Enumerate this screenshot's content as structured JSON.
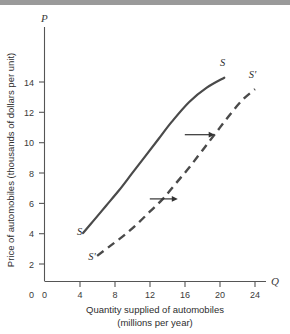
{
  "figure": {
    "background_color": "#ffffff",
    "top_band_color": "#9a9a9a",
    "curve_color": "#4a4a4a",
    "axis_color": "#555555"
  },
  "axes": {
    "y_symbol": "P",
    "x_symbol": "Q",
    "y_title": "Price of automobiles (thousands of dollars per unit)",
    "x_title_line1": "Quantity supplied of automobiles",
    "x_title_line2": "(millions per year)",
    "origin_label": "0"
  },
  "chart_data": {
    "type": "line",
    "title": "",
    "xlabel": "Quantity supplied of automobiles (millions per year)",
    "ylabel": "Price of automobiles (thousands of dollars per unit)",
    "xlim": [
      0,
      26
    ],
    "ylim": [
      0,
      15.5
    ],
    "xticks": [
      0,
      4,
      8,
      12,
      16,
      20,
      24
    ],
    "yticks": [
      0,
      2,
      4,
      6,
      8,
      10,
      12,
      14
    ],
    "xtick_labels": [
      "0",
      "4",
      "8",
      "12",
      "16",
      "20",
      "24"
    ],
    "ytick_labels": [
      "0",
      "2",
      "4",
      "6",
      "8",
      "10",
      "12",
      "14"
    ],
    "grid": false,
    "legend": "none",
    "series": [
      {
        "name": "S",
        "label": "S",
        "style": "solid",
        "label_position": "top",
        "points": [
          [
            4.4,
            3.4
          ],
          [
            5.5,
            4.2
          ],
          [
            7.0,
            5.3
          ],
          [
            8.5,
            6.4
          ],
          [
            10.0,
            7.6
          ],
          [
            11.5,
            8.8
          ],
          [
            13.0,
            10.0
          ],
          [
            14.5,
            11.2
          ],
          [
            16.5,
            12.6
          ],
          [
            18.5,
            13.6
          ],
          [
            20.5,
            14.3
          ]
        ],
        "bottom_label": "S",
        "top_label": "S"
      },
      {
        "name": "S-prime",
        "label": "S'",
        "style": "dashed",
        "label_position": "top",
        "points": [
          [
            6.0,
            1.8
          ],
          [
            7.5,
            2.5
          ],
          [
            9.0,
            3.2
          ],
          [
            10.5,
            4.0
          ],
          [
            12.0,
            4.9
          ],
          [
            13.5,
            5.8
          ],
          [
            15.0,
            6.9
          ],
          [
            16.5,
            8.0
          ],
          [
            18.0,
            9.2
          ],
          [
            19.5,
            10.4
          ],
          [
            21.0,
            11.6
          ],
          [
            22.5,
            12.7
          ],
          [
            24.0,
            13.5
          ]
        ],
        "bottom_label": "S'",
        "top_label": "S'"
      }
    ],
    "annotations": [
      {
        "kind": "arrow",
        "name": "upper-shift-arrow",
        "direction": "right",
        "from": [
          16.0,
          10.3
        ],
        "to": [
          19.4,
          10.3
        ]
      },
      {
        "kind": "arrow",
        "name": "lower-shift-arrow",
        "direction": "right",
        "from": [
          12.0,
          5.8
        ],
        "to": [
          15.2,
          5.8
        ]
      }
    ],
    "curve_labels": [
      {
        "text": "S",
        "x": 4.0,
        "y": 3.3,
        "name": "s-curve-lower-label"
      },
      {
        "text": "S",
        "x": 20.3,
        "y": 15.1,
        "name": "s-curve-upper-label"
      },
      {
        "text": "S'",
        "x": 5.4,
        "y": 1.5,
        "name": "s-prime-curve-lower-label"
      },
      {
        "text": "S'",
        "x": 23.7,
        "y": 14.3,
        "name": "s-prime-curve-upper-label"
      }
    ]
  }
}
